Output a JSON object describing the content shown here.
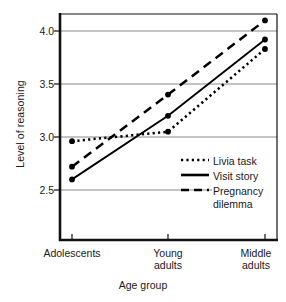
{
  "chart_data": {
    "type": "line",
    "title": "",
    "xlabel": "Age group",
    "ylabel": "Level of reasoning",
    "categories": [
      "Adolescents",
      "Young\nadults",
      "Middle\nadults"
    ],
    "category_labels_flat": [
      "Adolescents",
      "Young adults",
      "Middle adults"
    ],
    "yticks": [
      "2.5",
      "3.0",
      "3.5",
      "4.0"
    ],
    "ytick_values": [
      2.5,
      3.0,
      3.5,
      4.0
    ],
    "ylim": [
      2.25,
      4.2
    ],
    "grid": "horizontal",
    "legend_position": "inside-lower-right",
    "series": [
      {
        "name": "Livia task",
        "style": "dotted",
        "color": "#000000",
        "markers": true,
        "values": [
          2.96,
          3.05,
          3.83
        ]
      },
      {
        "name": "Visit story",
        "style": "solid",
        "color": "#000000",
        "markers": true,
        "values": [
          2.6,
          3.2,
          3.92
        ]
      },
      {
        "name": "Pregnancy\ndilemma",
        "style": "dashed",
        "color": "#000000",
        "markers": true,
        "values": [
          2.72,
          3.4,
          4.1
        ]
      }
    ]
  },
  "legend": {
    "entries": [
      {
        "label": "Livia task",
        "style": "dotted"
      },
      {
        "label": "Visit story",
        "style": "solid"
      },
      {
        "label": "Pregnancy\ndilemma",
        "style": "dashed"
      }
    ]
  },
  "colors": {
    "background": "#ffffff",
    "axis": "#111111",
    "gridline": "#8a8a8a",
    "data": "#000000",
    "text": "#1a1a1a"
  },
  "axes": {
    "y_title": "Level of reasoning",
    "x_title": "Age group",
    "ytick_0": "2.5",
    "ytick_1": "3.0",
    "ytick_2": "3.5",
    "ytick_3": "4.0",
    "xtick_0": "Adolescents",
    "xtick_1": "Young\nadults",
    "xtick_2": "Middle\nadults"
  }
}
